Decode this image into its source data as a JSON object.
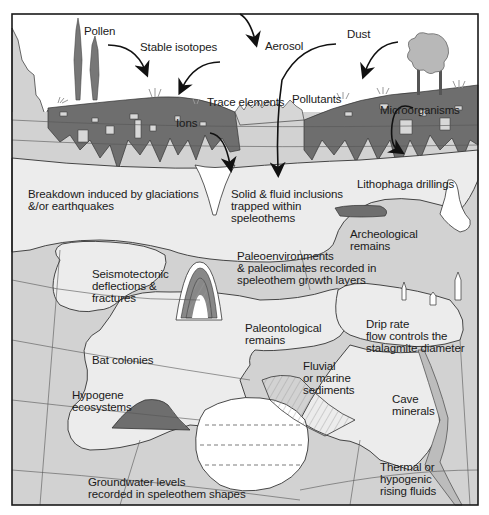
{
  "figure": {
    "colors": {
      "frame": "#1a1a1a",
      "sky": "#ffffff",
      "bedrock": "#d2d2d2",
      "soil": "#6e6e6e",
      "cave_void": "#ececec",
      "speleothem_white": "#ffffff",
      "tree_dark": "#777777",
      "tree_light": "#b8b8b8",
      "arrow": "#111111"
    }
  },
  "labels": {
    "surface": {
      "pollen": "Pollen",
      "stable_isotopes": "Stable isotopes",
      "aerosol": "Aerosol",
      "dust": "Dust",
      "trace_elements": "Trace elements",
      "pollutants": "Pollutants",
      "microorganisms": "Microorganisms",
      "ions": "Ions"
    },
    "cave": {
      "breakdown": "Breakdown induced by glaciations\n&/or earthquakes",
      "solid_fluid": "Solid & fluid inclusions\ntrapped within\nspeleothems",
      "lithophaga": "Lithophaga drillings",
      "archeological": "Archeological\nremains",
      "seismotectonic": "Seismotectonic\ndeflections &\nfractures",
      "paleoenvironments": "Paleoenvironments\n& paleoclimates recorded in\nspeleothem growth layers",
      "paleontological": "Paleontological\nremains",
      "drip_rate": "Drip rate\nflow controls the\nstalagmite diameter",
      "bat_colonies": "Bat colonies",
      "fluvial": "Fluvial\nor marine\nsediments",
      "hypogene": "Hypogene\necosystems",
      "cave_minerals": "Cave\nminerals",
      "groundwater": "Groundwater levels\nrecorded in speleothem shapes",
      "thermal": "Thermal or\nhypogenic\nrising fluids"
    }
  }
}
